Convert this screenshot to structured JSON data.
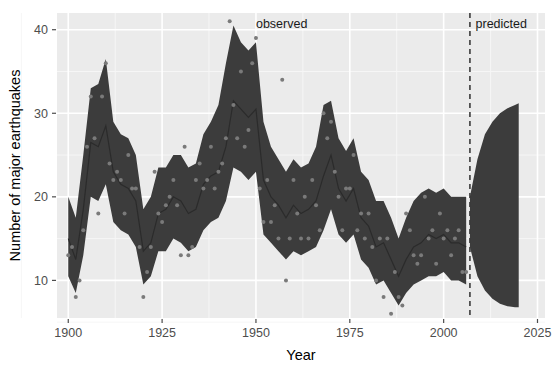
{
  "chart_data": {
    "type": "line",
    "title": "",
    "xlabel": "Year",
    "ylabel": "Number of major earthquakes",
    "xlim": [
      1897,
      2027
    ],
    "ylim": [
      5.5,
      42
    ],
    "xticks": [
      1900,
      1925,
      1950,
      1975,
      2000,
      2025
    ],
    "xticklabels": [
      "1900",
      "1925",
      "1950",
      "1975",
      "2000",
      "2025"
    ],
    "yticks": [
      10,
      20,
      30,
      40
    ],
    "yticklabels": [
      "10",
      "20",
      "30",
      "40"
    ],
    "grid": true,
    "legend_position": "none",
    "annotations": [
      {
        "text": "observed",
        "x": 1950,
        "y": 40.2,
        "name": "observed-label"
      },
      {
        "text": "predicted",
        "x": 2008.5,
        "y": 40.2,
        "name": "predicted-label"
      }
    ],
    "vline": {
      "x": 2007,
      "style": "dashed",
      "color": "#3b3b3b"
    },
    "colors": {
      "panel_background": "#ebebeb",
      "grid_major": "#ffffff",
      "grid_minor": "#f6f6f6",
      "ribbon": "#3c3c3c",
      "fit_line": "#2b2b2b",
      "point": "#7a7a7a",
      "axis_text": "#4d4d4d"
    },
    "series": [
      {
        "name": "observed_counts",
        "type": "scatter",
        "x": [
          1900,
          1901,
          1902,
          1903,
          1904,
          1905,
          1906,
          1907,
          1908,
          1909,
          1910,
          1911,
          1912,
          1913,
          1914,
          1915,
          1916,
          1917,
          1918,
          1919,
          1920,
          1921,
          1922,
          1923,
          1924,
          1925,
          1926,
          1927,
          1928,
          1929,
          1930,
          1931,
          1932,
          1933,
          1934,
          1935,
          1936,
          1937,
          1938,
          1939,
          1940,
          1941,
          1942,
          1943,
          1944,
          1945,
          1946,
          1947,
          1948,
          1949,
          1950,
          1951,
          1952,
          1953,
          1954,
          1955,
          1956,
          1957,
          1958,
          1959,
          1960,
          1961,
          1962,
          1963,
          1964,
          1965,
          1966,
          1967,
          1968,
          1969,
          1970,
          1971,
          1972,
          1973,
          1974,
          1975,
          1976,
          1977,
          1978,
          1979,
          1980,
          1981,
          1982,
          1983,
          1984,
          1985,
          1986,
          1987,
          1988,
          1989,
          1990,
          1991,
          1992,
          1993,
          1994,
          1995,
          1996,
          1997,
          1998,
          1999,
          2000,
          2001,
          2002,
          2003,
          2004,
          2005,
          2006
        ],
        "y": [
          13,
          14,
          8,
          10,
          16,
          26,
          32,
          27,
          18,
          32,
          36,
          24,
          22,
          23,
          22,
          18,
          25,
          21,
          21,
          14,
          8,
          11,
          14,
          23,
          18,
          17,
          19,
          20,
          22,
          19,
          13,
          26,
          13,
          14,
          22,
          24,
          21,
          22,
          26,
          21,
          23,
          24,
          27,
          41,
          31,
          27,
          35,
          26,
          28,
          36,
          39,
          21,
          17,
          22,
          17,
          19,
          15,
          34,
          10,
          15,
          22,
          18,
          15,
          20,
          15,
          22,
          19,
          16,
          30,
          27,
          29,
          23,
          20,
          16,
          21,
          21,
          25,
          16,
          18,
          15,
          18,
          14,
          10,
          15,
          8,
          15,
          6,
          11,
          8,
          7,
          18,
          16,
          13,
          12,
          13,
          20,
          15,
          16,
          12,
          18,
          15,
          16,
          13,
          15,
          16,
          11,
          11
        ]
      },
      {
        "name": "fitted_mean",
        "type": "line",
        "x": [
          1900,
          1902,
          1904,
          1906,
          1908,
          1910,
          1912,
          1914,
          1916,
          1918,
          1920,
          1922,
          1924,
          1926,
          1928,
          1930,
          1932,
          1934,
          1936,
          1938,
          1940,
          1942,
          1944,
          1946,
          1948,
          1950,
          1952,
          1954,
          1956,
          1958,
          1960,
          1962,
          1964,
          1966,
          1968,
          1970,
          1972,
          1974,
          1976,
          1978,
          1980,
          1982,
          1984,
          1986,
          1988,
          1990,
          1992,
          1994,
          1996,
          1998,
          2000,
          2002,
          2004,
          2006
        ],
        "y": [
          15.0,
          12.5,
          18.5,
          26.5,
          26.0,
          28.5,
          23.0,
          21.5,
          21.0,
          19.5,
          13.5,
          14.5,
          18.0,
          18.5,
          20.0,
          19.5,
          18.0,
          18.5,
          21.5,
          22.5,
          23.0,
          26.0,
          31.5,
          30.5,
          29.5,
          30.5,
          22.0,
          20.0,
          19.0,
          17.5,
          19.0,
          18.0,
          18.5,
          19.5,
          22.5,
          25.0,
          21.0,
          19.5,
          21.0,
          17.5,
          16.5,
          14.0,
          14.5,
          12.5,
          10.5,
          12.5,
          14.0,
          14.5,
          15.5,
          15.0,
          15.5,
          14.5,
          14.5,
          14.0
        ]
      },
      {
        "name": "uncertainty_band_upper",
        "type": "ribbon_upper",
        "x": [
          1900,
          1902,
          1904,
          1906,
          1908,
          1910,
          1912,
          1914,
          1916,
          1918,
          1920,
          1922,
          1924,
          1926,
          1928,
          1930,
          1932,
          1934,
          1936,
          1938,
          1940,
          1942,
          1944,
          1946,
          1948,
          1950,
          1952,
          1954,
          1956,
          1958,
          1960,
          1962,
          1964,
          1966,
          1968,
          1970,
          1972,
          1974,
          1976,
          1978,
          1980,
          1982,
          1984,
          1986,
          1988,
          1990,
          1992,
          1994,
          1996,
          1998,
          2000,
          2002,
          2004,
          2006
        ],
        "y": [
          20.0,
          17.5,
          25.0,
          33.0,
          33.5,
          36.5,
          29.0,
          27.5,
          27.0,
          25.0,
          18.5,
          20.0,
          23.5,
          23.5,
          25.0,
          25.0,
          23.5,
          24.0,
          27.5,
          29.0,
          31.0,
          36.0,
          40.5,
          38.5,
          37.5,
          38.5,
          29.0,
          26.0,
          24.5,
          23.0,
          24.5,
          23.5,
          24.0,
          26.0,
          31.0,
          31.5,
          27.0,
          25.5,
          27.0,
          23.0,
          22.0,
          19.5,
          19.5,
          17.5,
          15.0,
          17.5,
          19.5,
          20.5,
          21.0,
          20.5,
          21.0,
          20.0,
          20.0,
          20.0
        ]
      },
      {
        "name": "uncertainty_band_lower",
        "type": "ribbon_lower",
        "x": [
          1900,
          1902,
          1904,
          1906,
          1908,
          1910,
          1912,
          1914,
          1916,
          1918,
          1920,
          1922,
          1924,
          1926,
          1928,
          1930,
          1932,
          1934,
          1936,
          1938,
          1940,
          1942,
          1944,
          1946,
          1948,
          1950,
          1952,
          1954,
          1956,
          1958,
          1960,
          1962,
          1964,
          1966,
          1968,
          1970,
          1972,
          1974,
          1976,
          1978,
          1980,
          1982,
          1984,
          1986,
          1988,
          1990,
          1992,
          1994,
          1996,
          1998,
          2000,
          2002,
          2004,
          2006
        ],
        "y": [
          10.5,
          8.5,
          13.0,
          20.0,
          19.5,
          21.5,
          17.0,
          16.0,
          15.5,
          14.0,
          9.5,
          10.5,
          13.5,
          13.5,
          15.0,
          14.5,
          13.5,
          14.0,
          16.0,
          17.0,
          17.5,
          19.5,
          23.5,
          23.0,
          22.0,
          23.0,
          15.5,
          14.5,
          13.5,
          12.5,
          13.5,
          13.0,
          13.5,
          14.0,
          16.0,
          18.5,
          15.5,
          14.5,
          15.5,
          12.5,
          11.5,
          9.5,
          10.0,
          8.5,
          7.0,
          8.5,
          9.5,
          10.0,
          10.5,
          10.5,
          11.0,
          10.0,
          10.0,
          9.5
        ]
      },
      {
        "name": "forecast_cone_upper",
        "type": "ribbon_upper",
        "x": [
          2007,
          2009,
          2011,
          2013,
          2015,
          2017,
          2019,
          2020
        ],
        "y": [
          20.0,
          24.5,
          27.5,
          29.0,
          30.0,
          30.6,
          31.0,
          31.2
        ]
      },
      {
        "name": "forecast_cone_lower",
        "type": "ribbon_lower",
        "x": [
          2007,
          2009,
          2011,
          2013,
          2015,
          2017,
          2019,
          2020
        ],
        "y": [
          14.0,
          10.5,
          8.8,
          7.8,
          7.2,
          6.9,
          6.8,
          6.8
        ]
      }
    ]
  }
}
